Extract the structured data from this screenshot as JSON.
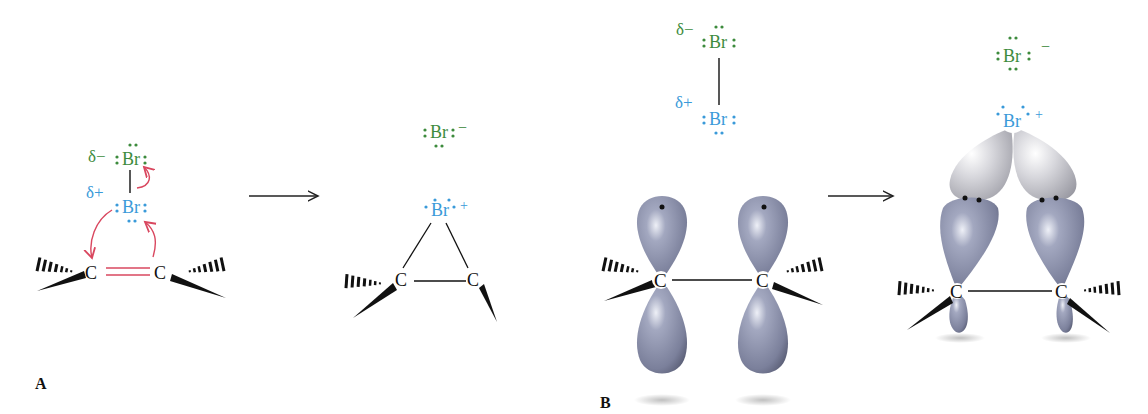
{
  "panels": {
    "a": {
      "label": "A",
      "reactant": {
        "top_br": {
          "delta": "δ−",
          "symbol": "Br",
          "color": "#3d8b3d"
        },
        "bottom_br": {
          "delta": "δ+",
          "symbol": "Br",
          "color": "#3a9ad9"
        },
        "carbon_left": "C",
        "carbon_right": "C"
      },
      "product": {
        "bromide": {
          "symbol": "Br",
          "charge": "−",
          "color": "#3d8b3d"
        },
        "bromonium": {
          "symbol": "Br",
          "charge": "+",
          "color": "#3a9ad9"
        },
        "carbon_left": "C",
        "carbon_right": "C"
      }
    },
    "b": {
      "label": "B",
      "reactant": {
        "top_br": {
          "delta": "δ−",
          "symbol": "Br",
          "color": "#3d8b3d"
        },
        "bottom_br": {
          "delta": "δ+",
          "symbol": "Br",
          "color": "#3a9ad9"
        },
        "carbon_left": "C",
        "carbon_right": "C"
      },
      "product": {
        "bromide": {
          "symbol": "Br",
          "charge": "−",
          "color": "#3d8b3d"
        },
        "bromonium": {
          "symbol": "Br",
          "charge": "+",
          "color": "#3a9ad9"
        },
        "carbon_left": "C",
        "carbon_right": "C"
      }
    }
  },
  "colors": {
    "arrow_curved": "#d9475f",
    "double_bond": "#d9475f",
    "orbital_carbon": "#8e93ad",
    "orbital_bromine": "#c9c9cf",
    "bond": "#111111"
  }
}
